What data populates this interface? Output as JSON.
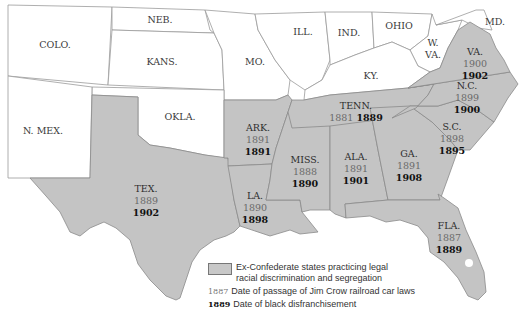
{
  "colors": {
    "confederate_fill": "#c4c4c4",
    "other_fill": "#ffffff",
    "border": "#8a8a8a"
  },
  "states_other": [
    {
      "label": "COLO."
    },
    {
      "label": "NEB."
    },
    {
      "label": "KANS."
    },
    {
      "label": "MO."
    },
    {
      "label": "ILL."
    },
    {
      "label": "IND."
    },
    {
      "label": "OHIO"
    },
    {
      "label": "MD."
    },
    {
      "label": "W.\nVA."
    },
    {
      "label": "KY."
    },
    {
      "label": "OKLA."
    },
    {
      "label": "N. MEX."
    }
  ],
  "states_confederate": [
    {
      "label": "VA.",
      "jim_crow": "1900",
      "disfranchisement": "1902"
    },
    {
      "label": "N.C.",
      "jim_crow": "1899",
      "disfranchisement": "1900"
    },
    {
      "label": "TENN.",
      "jim_crow": "1881",
      "disfranchisement": "1889"
    },
    {
      "label": "S.C.",
      "jim_crow": "1898",
      "disfranchisement": "1895"
    },
    {
      "label": "ARK.",
      "jim_crow": "1891",
      "disfranchisement": "1891"
    },
    {
      "label": "MISS.",
      "jim_crow": "1888",
      "disfranchisement": "1890"
    },
    {
      "label": "ALA.",
      "jim_crow": "1891",
      "disfranchisement": "1901"
    },
    {
      "label": "GA.",
      "jim_crow": "1891",
      "disfranchisement": "1908"
    },
    {
      "label": "LA.",
      "jim_crow": "1890",
      "disfranchisement": "1898"
    },
    {
      "label": "TEX.",
      "jim_crow": "1889",
      "disfranchisement": "1902"
    },
    {
      "label": "FLA.",
      "jim_crow": "1887",
      "disfranchisement": "1889"
    }
  ],
  "legend": {
    "swatch_label_line1": "Ex-Confederate states practicing legal",
    "swatch_label_line2": "racial discrimination and segregation",
    "jim_crow_sample": "1887",
    "jim_crow_label": "Date of passage of Jim Crow railroad car laws",
    "disfranchisement_sample": "1889",
    "disfranchisement_label": "Date of black disfranchisement"
  }
}
